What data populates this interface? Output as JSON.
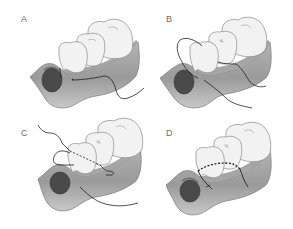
{
  "figure": {
    "title": "",
    "colors": {
      "gum_light": "#c9c9c9",
      "gum_dark": "#8c8c8c",
      "gum_outline": "#7a7a7a",
      "socket": "#4a4a4a",
      "tooth_fill": "#f2f2f2",
      "tooth_outline": "#8a8a8a",
      "suture": "#222222",
      "label": "#6a6a6a"
    },
    "panels": [
      {
        "id": "A",
        "label": "A",
        "description": "Suture needle passed through buccal papilla, thread running along gingiva"
      },
      {
        "id": "B",
        "label": "B",
        "description": "Suture looped around tooth crown between papillae"
      },
      {
        "id": "C",
        "label": "C",
        "description": "Suture passed lingually behind tooth (dashed) and back out buccally"
      },
      {
        "id": "D",
        "label": "D",
        "description": "Suture tied; sling suture line (dashed) across tooth with knot ends"
      }
    ]
  }
}
